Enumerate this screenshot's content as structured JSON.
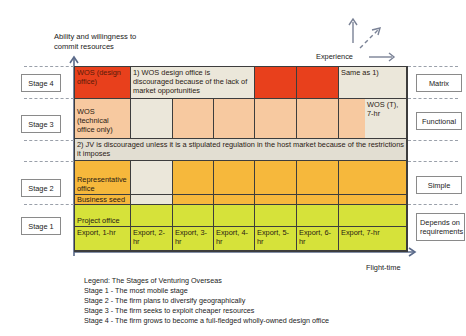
{
  "axes": {
    "y_label_line1": "Ability and willingness to",
    "y_label_line2": "commit resources",
    "x_label": "Flight-time",
    "experience_label": "Experience"
  },
  "colors": {
    "stage4_red": "#e8401c",
    "stage3_peach": "#f7c9a0",
    "neutral_gray": "#ebe7da",
    "stage2_orange": "#f6b83c",
    "stage1_lime": "#d6e23a",
    "axis_blue": "#5a6a8a"
  },
  "stages": [
    {
      "label": "Stage 4",
      "type": "Matrix"
    },
    {
      "label": "Stage 3",
      "type": "Functional"
    },
    {
      "label": "Stage 2",
      "type": "Simple"
    },
    {
      "label": "Stage 1",
      "type": "Depends on requirements"
    }
  ],
  "cells": {
    "wos_design": "WOS (design office)",
    "note1": "1) WOS design office is discouraged because of the lack of market opportunities",
    "same_as": "Same as 1)",
    "wos_technical": "WOS (technical office only)",
    "wos_t": "WOS (T), 7-hr",
    "note2": "2) JV is discouraged unless it is a stipulated regulation in the host market because of the restrictions it imposes",
    "rep_office": "Representative office",
    "business_seed": "Business seed",
    "project_office": "Project office"
  },
  "exports": [
    "Export, 1-hr",
    "Export, 2-hr",
    "Export, 3-hr",
    "Export, 4-hr",
    "Export, 5-hr",
    "Export, 6-hr",
    "Export, 7-hr"
  ],
  "legend": {
    "title": "Legend: The Stages of Venturing Overseas",
    "items": [
      "Stage 1 - The most mobile stage",
      "Stage 2 - The firm plans to diversify geographically",
      "Stage 3 - The firm seeks to exploit cheaper resources",
      "Stage 4 - The firm grows to become a full-fledged wholly-owned design office"
    ]
  }
}
